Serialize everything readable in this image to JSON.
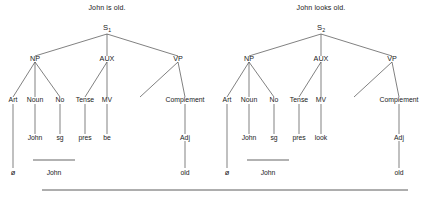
{
  "figure": {
    "type": "syntactic-tree-pair",
    "ink_color": "#333333",
    "background": "#ffffff"
  },
  "trees": [
    {
      "id": "tree-left",
      "caption": "John is old.",
      "root": {
        "label": "S",
        "subscript": "1"
      },
      "level1": [
        {
          "label": "NP"
        },
        {
          "label": "AUX"
        },
        {
          "label": "VP"
        }
      ],
      "level2": [
        {
          "label": "Art"
        },
        {
          "label": "Noun"
        },
        {
          "label": "No"
        },
        {
          "label": "Tense"
        },
        {
          "label": "MV"
        },
        {
          "label": "Complement"
        }
      ],
      "level3": [
        {
          "label": "John"
        },
        {
          "label": "sg"
        },
        {
          "label": "pres"
        },
        {
          "label": "be"
        },
        {
          "label": "Adj"
        }
      ],
      "level4": [
        {
          "label": "ø"
        },
        {
          "label": "John"
        },
        {
          "label": "old"
        }
      ],
      "np_rule": true
    },
    {
      "id": "tree-right",
      "caption": "John looks old.",
      "root": {
        "label": "S",
        "subscript": "2"
      },
      "level1": [
        {
          "label": "NP"
        },
        {
          "label": "AUX"
        },
        {
          "label": "VP"
        }
      ],
      "level2": [
        {
          "label": "Art"
        },
        {
          "label": "Noun"
        },
        {
          "label": "No"
        },
        {
          "label": "Tense"
        },
        {
          "label": "MV"
        },
        {
          "label": "Complement"
        }
      ],
      "level3": [
        {
          "label": "John"
        },
        {
          "label": "sg"
        },
        {
          "label": "pres"
        },
        {
          "label": "look"
        },
        {
          "label": "Adj"
        }
      ],
      "level4": [
        {
          "label": "ø"
        },
        {
          "label": "John"
        },
        {
          "label": "old"
        }
      ],
      "np_rule": true
    }
  ],
  "bottom_rule": {
    "present": true
  }
}
